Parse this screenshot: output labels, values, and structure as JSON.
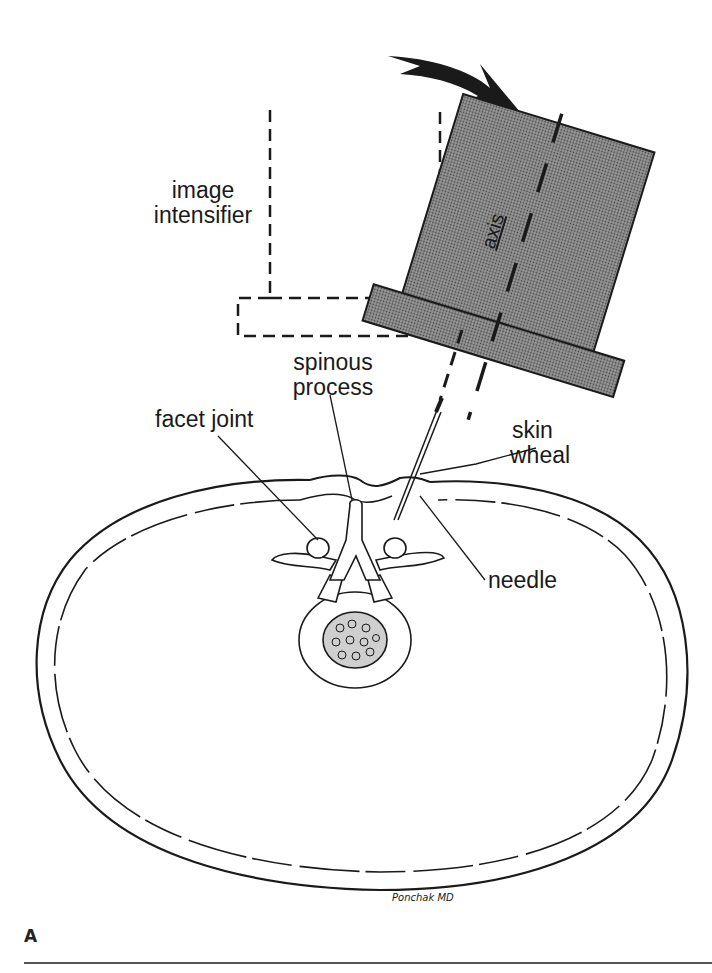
{
  "figure": {
    "panel_label": "A",
    "signature": "Ponchak MD",
    "labels": {
      "image_intensifier_line1": "image",
      "image_intensifier_line2": "intensifier",
      "axis": "axis",
      "spinous_process_line1": "spinous",
      "spinous_process_line2": "process",
      "facet_joint": "facet joint",
      "skin_wheal_line1": "skin",
      "skin_wheal_line2": "wheal",
      "needle": "needle"
    },
    "colors": {
      "ink": "#1a1a1a",
      "intensifier_fill": "#7a7a7a",
      "background": "#ffffff"
    }
  }
}
